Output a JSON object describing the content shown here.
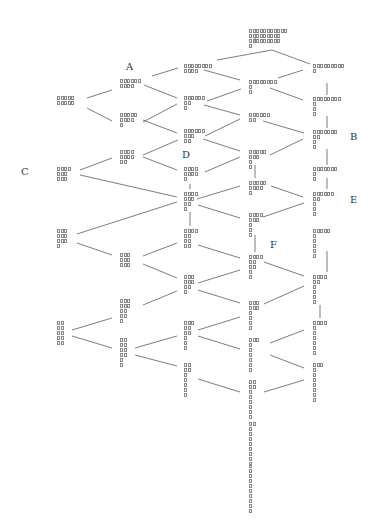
{
  "diagram": {
    "type": "lattice-tree",
    "labels": [
      {
        "id": "A",
        "text": "A",
        "x": 126,
        "y": 62
      },
      {
        "id": "B",
        "text": "B",
        "x": 350,
        "y": 132
      },
      {
        "id": "C",
        "text": "C",
        "x": 21,
        "y": 167
      },
      {
        "id": "D",
        "text": "D",
        "x": 182,
        "y": 150
      },
      {
        "id": "E",
        "text": "E",
        "x": 350,
        "y": 195
      },
      {
        "id": "F",
        "text": "F",
        "x": 270,
        "y": 240
      }
    ],
    "nodes": [
      {
        "id": "n0",
        "x": 249,
        "y": 29,
        "rows": [
          11,
          9,
          9,
          1
        ]
      },
      {
        "id": "c3a",
        "x": 184,
        "y": 64,
        "rows": [
          8,
          4
        ]
      },
      {
        "id": "c5a",
        "x": 313,
        "y": 64,
        "rows": [
          9,
          1
        ]
      },
      {
        "id": "c2a",
        "x": 120,
        "y": 79,
        "rows": [
          6,
          4
        ]
      },
      {
        "id": "c4a",
        "x": 249,
        "y": 80,
        "rows": [
          8,
          1,
          1
        ]
      },
      {
        "id": "c1a",
        "x": 57,
        "y": 96,
        "rows": [
          5,
          5
        ]
      },
      {
        "id": "c3b",
        "x": 184,
        "y": 96,
        "rows": [
          6,
          2,
          1
        ]
      },
      {
        "id": "c5b",
        "x": 313,
        "y": 97,
        "rows": [
          8,
          1,
          1,
          1
        ]
      },
      {
        "id": "c2b",
        "x": 120,
        "y": 113,
        "rows": [
          5,
          4,
          1
        ]
      },
      {
        "id": "c4b",
        "x": 249,
        "y": 113,
        "rows": [
          6,
          2
        ]
      },
      {
        "id": "c3c",
        "x": 184,
        "y": 129,
        "rows": [
          6,
          3,
          2
        ]
      },
      {
        "id": "c5c",
        "x": 313,
        "y": 130,
        "rows": [
          7,
          2,
          1,
          1
        ]
      },
      {
        "id": "c2c",
        "x": 120,
        "y": 150,
        "rows": [
          4,
          4,
          2
        ]
      },
      {
        "id": "c4c",
        "x": 249,
        "y": 150,
        "rows": [
          5,
          3,
          1,
          1
        ]
      },
      {
        "id": "c1b",
        "x": 57,
        "y": 167,
        "rows": [
          4,
          3,
          3
        ]
      },
      {
        "id": "c3d",
        "x": 184,
        "y": 167,
        "rows": [
          4,
          4,
          1
        ]
      },
      {
        "id": "c5d",
        "x": 313,
        "y": 167,
        "rows": [
          7,
          1,
          1
        ]
      },
      {
        "id": "c4d",
        "x": 249,
        "y": 181,
        "rows": [
          5,
          4,
          1
        ]
      },
      {
        "id": "c3e",
        "x": 184,
        "y": 192,
        "rows": [
          4,
          3,
          2,
          1
        ]
      },
      {
        "id": "c5e",
        "x": 313,
        "y": 192,
        "rows": [
          6,
          2,
          1,
          1,
          1
        ]
      },
      {
        "id": "c4e",
        "x": 249,
        "y": 213,
        "rows": [
          4,
          3,
          1,
          1,
          1
        ]
      },
      {
        "id": "c1c",
        "x": 57,
        "y": 229,
        "rows": [
          3,
          3,
          3,
          1
        ]
      },
      {
        "id": "c3f",
        "x": 184,
        "y": 229,
        "rows": [
          4,
          2,
          2,
          2
        ]
      },
      {
        "id": "c5f",
        "x": 313,
        "y": 229,
        "rows": [
          5,
          1,
          1,
          1,
          1,
          1
        ]
      },
      {
        "id": "c2d",
        "x": 120,
        "y": 253,
        "rows": [
          3,
          3,
          3
        ]
      },
      {
        "id": "c4f",
        "x": 249,
        "y": 255,
        "rows": [
          4,
          2,
          2,
          1,
          1
        ]
      },
      {
        "id": "c3g",
        "x": 184,
        "y": 275,
        "rows": [
          3,
          3,
          2,
          1
        ]
      },
      {
        "id": "c5g",
        "x": 313,
        "y": 275,
        "rows": [
          4,
          2,
          1,
          1,
          1,
          1
        ]
      },
      {
        "id": "c2e",
        "x": 120,
        "y": 299,
        "rows": [
          3,
          3,
          2,
          2,
          1
        ]
      },
      {
        "id": "c4g",
        "x": 249,
        "y": 301,
        "rows": [
          3,
          3,
          1,
          1,
          1,
          1
        ]
      },
      {
        "id": "c1d",
        "x": 57,
        "y": 321,
        "rows": [
          2,
          2,
          2,
          2,
          2
        ]
      },
      {
        "id": "c3h",
        "x": 184,
        "y": 321,
        "rows": [
          3,
          2,
          2,
          1,
          1,
          1
        ]
      },
      {
        "id": "c5h",
        "x": 313,
        "y": 321,
        "rows": [
          4,
          1,
          1,
          1,
          1,
          1,
          1
        ]
      },
      {
        "id": "c2f",
        "x": 120,
        "y": 338,
        "rows": [
          2,
          2,
          2,
          2,
          1,
          1
        ]
      },
      {
        "id": "c4h",
        "x": 249,
        "y": 338,
        "rows": [
          3,
          1,
          1,
          1,
          1,
          1,
          1
        ]
      },
      {
        "id": "c3i",
        "x": 184,
        "y": 363,
        "rows": [
          2,
          2,
          1,
          1,
          1,
          1,
          1
        ]
      },
      {
        "id": "c5i",
        "x": 313,
        "y": 363,
        "rows": [
          3,
          1,
          1,
          1,
          1,
          1,
          1,
          1
        ]
      },
      {
        "id": "c4i",
        "x": 249,
        "y": 380,
        "rows": [
          2,
          2,
          1,
          1,
          1,
          1,
          1,
          1
        ]
      },
      {
        "id": "c4j",
        "x": 249,
        "y": 422,
        "rows": [
          2,
          1,
          1,
          1,
          1,
          1,
          1,
          1,
          1
        ]
      },
      {
        "id": "c4k",
        "x": 249,
        "y": 464,
        "rows": [
          1,
          1,
          1,
          1,
          1,
          1,
          1,
          1,
          1,
          1
        ]
      }
    ],
    "edges": [
      [
        217,
        60,
        272,
        50
      ],
      [
        272,
        50,
        310,
        64
      ],
      [
        152,
        76,
        178,
        68
      ],
      [
        204,
        70,
        240,
        80
      ],
      [
        278,
        78,
        303,
        70
      ],
      [
        87,
        98,
        112,
        90
      ],
      [
        144,
        85,
        177,
        98
      ],
      [
        270,
        88,
        303,
        100
      ],
      [
        87,
        108,
        112,
        121
      ],
      [
        143,
        122,
        177,
        104
      ],
      [
        204,
        105,
        240,
        115
      ],
      [
        207,
        101,
        241,
        89
      ],
      [
        143,
        120,
        177,
        133
      ],
      [
        263,
        121,
        304,
        133
      ],
      [
        205,
        136,
        240,
        119
      ],
      [
        143,
        155,
        178,
        140
      ],
      [
        203,
        139,
        240,
        151
      ],
      [
        270,
        155,
        303,
        139
      ],
      [
        80,
        170,
        112,
        158
      ],
      [
        143,
        157,
        177,
        170
      ],
      [
        205,
        172,
        240,
        157
      ],
      [
        80,
        175,
        177,
        197
      ],
      [
        271,
        186,
        303,
        197
      ],
      [
        197,
        199,
        240,
        186
      ],
      [
        198,
        205,
        240,
        218
      ],
      [
        263,
        217,
        304,
        203
      ],
      [
        77,
        234,
        177,
        202
      ],
      [
        77,
        243,
        112,
        255
      ],
      [
        143,
        256,
        177,
        243
      ],
      [
        198,
        245,
        240,
        258
      ],
      [
        264,
        262,
        304,
        276
      ],
      [
        143,
        264,
        177,
        278
      ],
      [
        198,
        283,
        240,
        270
      ],
      [
        198,
        290,
        240,
        303
      ],
      [
        264,
        304,
        304,
        286
      ],
      [
        143,
        305,
        177,
        291
      ],
      [
        72,
        330,
        112,
        318
      ],
      [
        72,
        336,
        112,
        348
      ],
      [
        135,
        348,
        177,
        336
      ],
      [
        198,
        330,
        240,
        317
      ],
      [
        198,
        336,
        240,
        349
      ],
      [
        270,
        343,
        304,
        330
      ],
      [
        135,
        355,
        177,
        366
      ],
      [
        270,
        355,
        304,
        368
      ],
      [
        198,
        379,
        240,
        392
      ],
      [
        264,
        392,
        304,
        380
      ]
    ],
    "verticals": [
      [
        255,
        38,
        255,
        43
      ],
      [
        327,
        83,
        327,
        95
      ],
      [
        327,
        116,
        327,
        128
      ],
      [
        327,
        149,
        327,
        165
      ],
      [
        255,
        165,
        255,
        178
      ],
      [
        190,
        184,
        190,
        189
      ],
      [
        190,
        212,
        190,
        226
      ],
      [
        327,
        178,
        327,
        189
      ],
      [
        255,
        235,
        255,
        252
      ],
      [
        327,
        251,
        327,
        272
      ],
      [
        320,
        305,
        320,
        318
      ]
    ]
  }
}
